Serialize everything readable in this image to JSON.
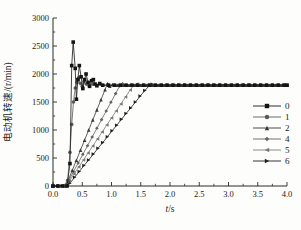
{
  "figure": {
    "bg": "#fdfdfb",
    "axis_color": "#2a2a2a"
  },
  "chart_data": {
    "type": "line",
    "title": "",
    "xlabel": "t/s",
    "xlabel_var": "t",
    "xlabel_unit": "/s",
    "ylabel": "电动机转速/(r/min)",
    "xlim": [
      0,
      4
    ],
    "ylim": [
      0,
      3000
    ],
    "x_tick_values": [
      0,
      0.5,
      1,
      1.5,
      2,
      2.5,
      3,
      3.5,
      4
    ],
    "x_tick_labels": [
      "0.0",
      "0.5",
      "1.0",
      "1.5",
      "2.0",
      "2.5",
      "3.0",
      "3.5",
      "4.0"
    ],
    "x_minor_values": [
      0.25,
      0.75,
      1.25,
      1.75,
      2.25,
      2.75,
      3.25,
      3.75
    ],
    "y_tick_values": [
      0,
      500,
      1000,
      1500,
      2000,
      2500,
      3000
    ],
    "y_tick_labels": [
      "0",
      "500",
      "1000",
      "1500",
      "2000",
      "2500",
      "3000"
    ],
    "y_minor_values": [
      250,
      750,
      1250,
      1750,
      2250,
      2750
    ],
    "grid": false,
    "legend_position": "right-middle",
    "steady_value": 1800,
    "steady_step": 0.1,
    "x_end": 4.0,
    "series": [
      {
        "name": "0",
        "marker": "square",
        "color": "#141414",
        "points": [
          [
            0,
            0
          ],
          [
            0.08,
            0
          ],
          [
            0.16,
            0
          ],
          [
            0.24,
            0
          ],
          [
            0.29,
            400
          ],
          [
            0.32,
            2150
          ],
          [
            0.345,
            2570
          ],
          [
            0.38,
            2100
          ],
          [
            0.4,
            1550
          ],
          [
            0.425,
            1900
          ],
          [
            0.45,
            2150
          ],
          [
            0.48,
            1950
          ],
          [
            0.51,
            1740
          ],
          [
            0.54,
            1900
          ],
          [
            0.565,
            2000
          ],
          [
            0.6,
            1850
          ],
          [
            0.625,
            1780
          ],
          [
            0.66,
            1880
          ],
          [
            0.69,
            1900
          ],
          [
            0.72,
            1820
          ],
          [
            0.75,
            1790
          ],
          [
            0.8,
            1830
          ],
          [
            0.85,
            1800
          ]
        ],
        "steady_from": 0.95
      },
      {
        "name": "1",
        "marker": "circle",
        "color": "#5a5a5a",
        "points": [
          [
            0,
            0
          ],
          [
            0.09,
            0
          ],
          [
            0.18,
            0
          ],
          [
            0.25,
            100
          ],
          [
            0.29,
            600
          ],
          [
            0.32,
            1100
          ],
          [
            0.35,
            1500
          ],
          [
            0.38,
            1750
          ],
          [
            0.41,
            1850
          ],
          [
            0.44,
            1930
          ],
          [
            0.47,
            1830
          ],
          [
            0.5,
            1780
          ],
          [
            0.53,
            1860
          ],
          [
            0.57,
            1820
          ],
          [
            0.62,
            1790
          ],
          [
            0.68,
            1820
          ],
          [
            0.75,
            1800
          ]
        ],
        "steady_from": 0.85
      },
      {
        "name": "2",
        "marker": "triangle-up",
        "color": "#383838",
        "points": [
          [
            0,
            0
          ],
          [
            0.1,
            0
          ],
          [
            0.2,
            0
          ],
          [
            0.26,
            100
          ],
          [
            0.33,
            280
          ],
          [
            0.4,
            460
          ],
          [
            0.47,
            640
          ],
          [
            0.54,
            820
          ],
          [
            0.61,
            1000
          ],
          [
            0.68,
            1180
          ],
          [
            0.75,
            1360
          ],
          [
            0.82,
            1540
          ],
          [
            0.89,
            1720
          ],
          [
            0.93,
            1830
          ],
          [
            0.97,
            1780
          ],
          [
            1.02,
            1810
          ]
        ],
        "steady_from": 1.1
      },
      {
        "name": "4",
        "marker": "diamond",
        "color": "#636363",
        "points": [
          [
            0,
            0
          ],
          [
            0.1,
            0
          ],
          [
            0.2,
            0
          ],
          [
            0.27,
            100
          ],
          [
            0.35,
            255
          ],
          [
            0.43,
            410
          ],
          [
            0.51,
            565
          ],
          [
            0.59,
            720
          ],
          [
            0.67,
            875
          ],
          [
            0.75,
            1030
          ],
          [
            0.83,
            1185
          ],
          [
            0.91,
            1340
          ],
          [
            0.99,
            1495
          ],
          [
            1.07,
            1650
          ],
          [
            1.14,
            1785
          ],
          [
            1.19,
            1825
          ],
          [
            1.24,
            1795
          ]
        ],
        "steady_from": 1.33
      },
      {
        "name": "5",
        "marker": "triangle-left",
        "color": "#7a7a7a",
        "points": [
          [
            0,
            0
          ],
          [
            0.1,
            0
          ],
          [
            0.2,
            0
          ],
          [
            0.28,
            90
          ],
          [
            0.36,
            215
          ],
          [
            0.44,
            340
          ],
          [
            0.52,
            465
          ],
          [
            0.6,
            590
          ],
          [
            0.68,
            715
          ],
          [
            0.76,
            840
          ],
          [
            0.84,
            965
          ],
          [
            0.92,
            1090
          ],
          [
            1.0,
            1215
          ],
          [
            1.08,
            1340
          ],
          [
            1.16,
            1465
          ],
          [
            1.24,
            1590
          ],
          [
            1.32,
            1715
          ],
          [
            1.38,
            1800
          ],
          [
            1.43,
            1820
          ]
        ],
        "steady_from": 1.52
      },
      {
        "name": "6",
        "marker": "triangle-right",
        "color": "#1f1f1f",
        "points": [
          [
            0,
            0
          ],
          [
            0.1,
            0
          ],
          [
            0.2,
            0
          ],
          [
            0.29,
            50
          ],
          [
            0.37,
            155
          ],
          [
            0.45,
            260
          ],
          [
            0.53,
            365
          ],
          [
            0.61,
            465
          ],
          [
            0.69,
            570
          ],
          [
            0.77,
            675
          ],
          [
            0.85,
            775
          ],
          [
            0.93,
            880
          ],
          [
            1.01,
            985
          ],
          [
            1.09,
            1085
          ],
          [
            1.17,
            1190
          ],
          [
            1.25,
            1295
          ],
          [
            1.33,
            1395
          ],
          [
            1.41,
            1500
          ],
          [
            1.49,
            1605
          ],
          [
            1.57,
            1705
          ],
          [
            1.65,
            1795
          ],
          [
            1.7,
            1815
          ]
        ],
        "steady_from": 1.79
      }
    ]
  }
}
